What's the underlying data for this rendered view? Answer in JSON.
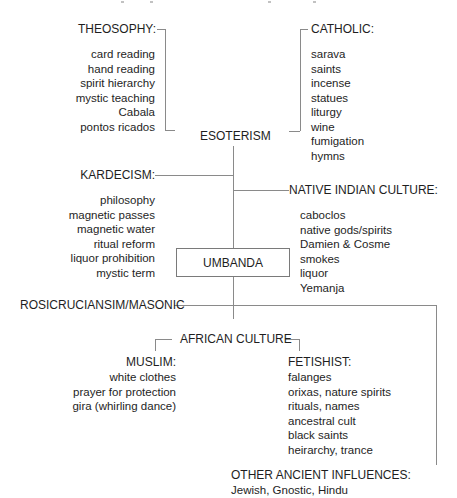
{
  "diagram": {
    "center": "UMBANDA",
    "esoterism": "ESOTERISM",
    "theosophy": {
      "heading": "THEOSOPHY:",
      "items": [
        "card reading",
        "hand reading",
        "spirit hierarchy",
        "mystic teaching",
        "Cabala",
        "pontos ricados"
      ]
    },
    "catholic": {
      "heading": "CATHOLIC:",
      "items": [
        "sarava",
        "saints",
        "incense",
        "statues",
        "liturgy",
        "wine",
        "fumigation",
        "hymns"
      ]
    },
    "kardecism": {
      "heading": "KARDECISM:",
      "items": [
        "philosophy",
        "magnetic passes",
        "magnetic water",
        "ritual reform",
        "liquor prohibition",
        "mystic term"
      ]
    },
    "native_indian": {
      "heading": "NATIVE INDIAN CULTURE:",
      "items": [
        "caboclos",
        "native gods/spirits",
        "Damien & Cosme",
        "smokes",
        "liquor",
        "Yemanja"
      ]
    },
    "rosicrucian": "ROSICRUCIANSIM/MASONIC",
    "african": {
      "heading": "AFRICAN CULTURE",
      "muslim": {
        "heading": "MUSLIM:",
        "items": [
          "white clothes",
          "prayer for protection",
          "gira (whirling dance)"
        ]
      },
      "fetishist": {
        "heading": "FETISHIST:",
        "items": [
          "falanges",
          "orixas, nature spirits",
          "rituals, names",
          "ancestral cult",
          "black saints",
          "heirarchy, trance"
        ]
      }
    },
    "other": {
      "heading": "OTHER ANCIENT INFLUENCES:",
      "items": "Jewish, Gnostic, Hindu"
    }
  }
}
